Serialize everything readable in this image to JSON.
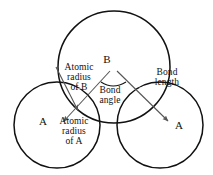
{
  "figure": {
    "background_color": "#ffffff",
    "outline_color": "#111111",
    "leader_color": "#555555",
    "text_color": "#111111",
    "width": 213,
    "height": 175
  },
  "atoms": [
    {
      "id": "atom-b",
      "label": "B",
      "role": "central-atom",
      "center_x": 114,
      "center_y": 67,
      "radius": 56
    },
    {
      "id": "atom-a-left",
      "label": "A",
      "role": "terminal-atom",
      "center_x": 57,
      "center_y": 125,
      "radius": 43
    },
    {
      "id": "atom-a-right",
      "label": "A",
      "role": "terminal-atom",
      "center_x": 160,
      "center_y": 125,
      "radius": 43
    }
  ],
  "labels": {
    "atom_b": "B",
    "atom_a_left": "A",
    "atom_a_right": "A",
    "atomic_radius_b": "Atomic\nradius\nof B",
    "atomic_radius_a": "Atomic\nradius\nof A",
    "bond_angle": "Bond\nangle",
    "bond_length": "Bond\nlength"
  },
  "annotations": [
    {
      "name": "atomic-radius-of-b",
      "label": "Atomic radius of B",
      "type": "arrow",
      "from_x": 57,
      "from_y": 68,
      "to_x": 80,
      "to_y": 113,
      "description": "arrow from the B circle edge toward the B centre direction"
    },
    {
      "name": "atomic-radius-of-a",
      "label": "Atomic radius of A",
      "type": "arrow",
      "from_x": 110,
      "from_y": 70,
      "to_x": 62,
      "to_y": 122,
      "description": "arrow crossing down-left into the left A circle"
    },
    {
      "name": "bond-length",
      "label": "Bond length",
      "type": "arrow",
      "from_x": 116,
      "from_y": 70,
      "to_x": 170,
      "to_y": 123,
      "description": "arrow from B centre to right A centre"
    },
    {
      "name": "bond-angle",
      "label": "Bond angle",
      "type": "arc",
      "vertex_x": 113,
      "vertex_y": 69,
      "description": "arc spanning the angle between the two bonds at B"
    }
  ]
}
